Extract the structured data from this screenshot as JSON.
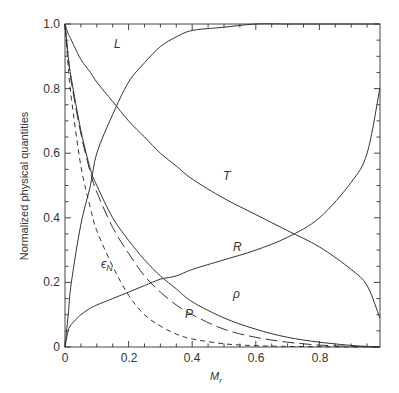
{
  "chart_data": {
    "type": "line",
    "title": "",
    "xlabel": "M_r",
    "xlabel_main": "M",
    "xlabel_sub": "r",
    "ylabel": "Normalized physical quantities",
    "xlim": [
      0,
      0.99
    ],
    "ylim": [
      0,
      1.0
    ],
    "grid": false,
    "legend": "none (curves labeled inline)",
    "x_ticks": [
      "0",
      "0.2",
      "0.4",
      "0.6",
      "0.8"
    ],
    "y_ticks": [
      "0",
      "0.2",
      "0.4",
      "0.6",
      "0.8",
      "1.0"
    ],
    "x": [
      0,
      0.01,
      0.02,
      0.05,
      0.08,
      0.1,
      0.15,
      0.2,
      0.25,
      0.3,
      0.35,
      0.4,
      0.5,
      0.6,
      0.7,
      0.8,
      0.9,
      0.95,
      0.99
    ],
    "series": [
      {
        "name": "L",
        "style": "solid",
        "values": [
          0,
          0.1,
          0.2,
          0.38,
          0.5,
          0.6,
          0.72,
          0.82,
          0.88,
          0.93,
          0.96,
          0.98,
          0.99,
          1.0,
          1.0,
          1.0,
          1.0,
          1.0,
          1.0
        ]
      },
      {
        "name": "T",
        "style": "solid",
        "values": [
          1.0,
          0.97,
          0.95,
          0.89,
          0.85,
          0.82,
          0.76,
          0.7,
          0.65,
          0.6,
          0.56,
          0.52,
          0.46,
          0.41,
          0.36,
          0.31,
          0.24,
          0.19,
          0.09
        ]
      },
      {
        "name": "R",
        "style": "solid",
        "values": [
          0,
          0.05,
          0.07,
          0.1,
          0.12,
          0.13,
          0.15,
          0.17,
          0.19,
          0.21,
          0.22,
          0.24,
          0.27,
          0.3,
          0.34,
          0.4,
          0.51,
          0.6,
          0.8
        ]
      },
      {
        "name": "rho",
        "label": "ρ",
        "style": "solid",
        "values": [
          1.0,
          0.9,
          0.83,
          0.67,
          0.55,
          0.5,
          0.4,
          0.33,
          0.27,
          0.22,
          0.18,
          0.14,
          0.09,
          0.055,
          0.03,
          0.015,
          0.005,
          0.002,
          0
        ]
      },
      {
        "name": "P",
        "style": "long-dash",
        "values": [
          1.0,
          0.9,
          0.82,
          0.66,
          0.54,
          0.48,
          0.37,
          0.29,
          0.22,
          0.17,
          0.13,
          0.1,
          0.055,
          0.03,
          0.015,
          0.006,
          0.002,
          0.001,
          0
        ]
      },
      {
        "name": "epsilon_N",
        "label": "ε_N",
        "style": "short-dash",
        "values": [
          1.0,
          0.87,
          0.77,
          0.56,
          0.43,
          0.36,
          0.25,
          0.16,
          0.1,
          0.065,
          0.04,
          0.025,
          0.01,
          0.004,
          0.002,
          0.001,
          0,
          0,
          0
        ]
      }
    ],
    "annotations": [
      {
        "text": "L",
        "x": 0.16,
        "y": 0.93
      },
      {
        "text": "T",
        "x": 0.43,
        "y": 0.46
      },
      {
        "text": "R",
        "x": 0.43,
        "y": 0.29
      },
      {
        "text": "ρ",
        "x": 0.46,
        "y": 0.16
      },
      {
        "text": "P",
        "x": 0.31,
        "y": 0.11
      },
      {
        "text": "ε_N",
        "x": 0.09,
        "y": 0.26
      }
    ]
  },
  "labels": {
    "y_axis_title": "Normalized physical quantities",
    "x_axis_title_main": "M",
    "x_axis_title_sub": "r",
    "curve_L": "L",
    "curve_T": "T",
    "curve_R": "R",
    "curve_rho": "ρ",
    "curve_P": "P",
    "curve_eps_main": "ϵ",
    "curve_eps_sub": "N",
    "x_tick_0": "0",
    "x_tick_1": "0.2",
    "x_tick_2": "0.4",
    "x_tick_3": "0.6",
    "x_tick_4": "0.8",
    "y_tick_0": "0",
    "y_tick_1": "0.2",
    "y_tick_2": "0.4",
    "y_tick_3": "0.6",
    "y_tick_4": "0.8",
    "y_tick_5": "1.0"
  }
}
